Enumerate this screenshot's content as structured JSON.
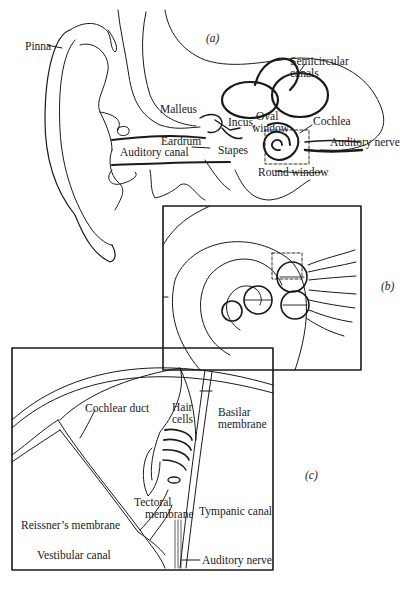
{
  "figure": {
    "panels": [
      {
        "id": "a",
        "tag": "(a)",
        "labels": {
          "pinna": "Pinna",
          "semicircular_canals_1": "Semicircular",
          "semicircular_canals_2": "canals",
          "malleus": "Malleus",
          "incus": "Incus,",
          "oval_window_1": "Oval",
          "oval_window_2": "window",
          "cochlea": "Cochlea",
          "eardrum": "Eardrum",
          "auditory_canal": "Auditory canal",
          "stapes": "Stapes",
          "auditory_nerve": "Auditory nerve",
          "round_window": "Round window"
        }
      },
      {
        "id": "b",
        "tag": "(b)"
      },
      {
        "id": "c",
        "tag": "(c)",
        "labels": {
          "cochlear_duct": "Cochlear duct",
          "hair_cells_1": "Hair",
          "hair_cells_2": "cells",
          "basilar_membrane_1": "Basilar",
          "basilar_membrane_2": "membrane",
          "tectoral_membrane_1": "Tectoral",
          "tectoral_membrane_2": "membrane",
          "reissners_membrane": "Reissner’s membrane",
          "tympanic_canal": "Tympanic canal",
          "vestibular_canal": "Vestibular canal",
          "auditory_nerve": "Auditory nerve"
        }
      }
    ],
    "colors": {
      "ink": "#1a1a1a",
      "background": "#ffffff"
    }
  }
}
